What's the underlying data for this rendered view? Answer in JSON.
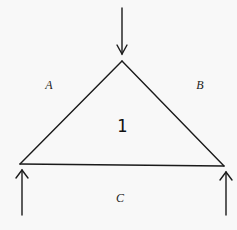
{
  "diagram": {
    "type": "force-triangle",
    "triangle": {
      "label": "1",
      "vertices": {
        "apex": [
          122,
          61
        ],
        "bottom_left": [
          20,
          164
        ],
        "bottom_right": [
          224,
          166
        ]
      }
    },
    "region_labels": {
      "a": "A",
      "b": "B",
      "c": "C"
    },
    "arrows": [
      {
        "name": "load-arrow-top",
        "direction": "down",
        "from": [
          122,
          8
        ],
        "to": [
          122,
          55
        ]
      },
      {
        "name": "reaction-arrow-left",
        "direction": "up",
        "from": [
          22,
          215
        ],
        "to": [
          22,
          170
        ]
      },
      {
        "name": "reaction-arrow-right",
        "direction": "up",
        "from": [
          226,
          215
        ],
        "to": [
          226,
          172
        ]
      }
    ],
    "colors": {
      "stroke": "#1a1a1a",
      "background": "#f8f8f8"
    }
  }
}
